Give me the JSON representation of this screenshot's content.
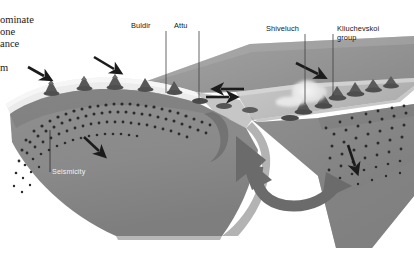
{
  "figure": {
    "type": "geological-block-diagram",
    "background_color": "#ffffff"
  },
  "caption": {
    "lines": [
      {
        "text": "ominate",
        "x": 0,
        "y": 14
      },
      {
        "text": "one",
        "x": 0,
        "y": 26
      },
      {
        "text": "ance",
        "x": 0,
        "y": 38
      },
      {
        "text": "m",
        "x": 0,
        "y": 62
      }
    ]
  },
  "labels": [
    {
      "name": "buldir",
      "text": "Buldir",
      "x": 131,
      "y": 22,
      "leader_x": 166,
      "leader_y1": 31,
      "leader_y2": 93
    },
    {
      "name": "attu",
      "text": "Attu",
      "x": 174,
      "y": 22,
      "leader_x": 199,
      "leader_y1": 31,
      "leader_y2": 100
    },
    {
      "name": "shiveluch",
      "text": "Shiveluch",
      "x": 266,
      "y": 25,
      "leader_x": 305,
      "leader_y1": 34,
      "leader_y2": 104
    },
    {
      "name": "kliuchevskoi",
      "text": "Kliuchevskoi",
      "x": 337,
      "y": 25,
      "leader_x": 333,
      "leader_y1": 34,
      "leader_y2": 96
    },
    {
      "name": "kliuchevskoi-group",
      "text": "group",
      "x": 337,
      "y": 34
    }
  ],
  "annotations": {
    "seismicity": {
      "text": "Seismicity",
      "x": 52,
      "y": 171,
      "leader_x": 50,
      "leader_y1": 130,
      "leader_y2": 172
    }
  },
  "colors": {
    "slab_face": "#8d8d8d",
    "slab_face_dark": "#7c7c7c",
    "upper_surface": "#b9b9b9",
    "upper_surface_light": "#cfcfcf",
    "backarc_sea": "#9c9c9c",
    "backarc_sea_dark": "#8a8a8a",
    "arc_strip": "#e8e8e8",
    "volcano": "#5f5f5f",
    "volcano_dark": "#4a4a4a",
    "seismicity_dot": "#2a2a2a",
    "arrow": "#1b1b1b",
    "rotation_arrow": "#6a6a6a",
    "plume": "#e2e2e2",
    "leader_line": "#4a4a4a",
    "text": "#161616",
    "text_light": "#f2f2f2"
  },
  "motion_arrows": [
    {
      "name": "convergence-arrow-far-west",
      "x1": 28,
      "y1": 68,
      "x2": 46,
      "y2": 77
    },
    {
      "name": "convergence-arrow-west",
      "x1": 94,
      "y1": 58,
      "x2": 116,
      "y2": 70
    },
    {
      "name": "strike-slip-arrow-east",
      "x1": 205,
      "y1": 97,
      "x2": 231,
      "y2": 97
    },
    {
      "name": "strike-slip-arrow-west",
      "x1": 244,
      "y1": 90,
      "x2": 219,
      "y2": 90
    },
    {
      "name": "convergence-arrow-kamchatka",
      "x1": 296,
      "y1": 64,
      "x2": 320,
      "y2": 75
    },
    {
      "name": "slab-dip-arrow-left",
      "x1": 85,
      "y1": 138,
      "x2": 101,
      "y2": 152
    },
    {
      "name": "slab-dip-arrow-right",
      "x1": 348,
      "y1": 146,
      "x2": 356,
      "y2": 168
    },
    {
      "name": "slab-rollback-arrow-large",
      "x1": 233,
      "y1": 141,
      "x2": 266,
      "y2": 175
    }
  ],
  "rotation_arrow": {
    "name": "slab-rotation-arrow",
    "cx": 300,
    "cy": 175
  },
  "volcanoes": {
    "aleutian_count": 7,
    "kamchatka_count": 7
  },
  "seismicity_band": {
    "left_dot_count": 86,
    "right_dot_count": 52
  }
}
